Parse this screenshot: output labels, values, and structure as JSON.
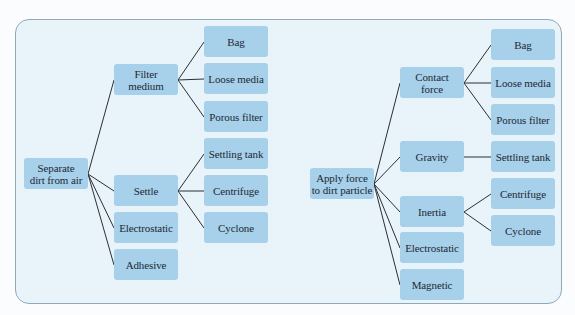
{
  "colors": {
    "panel_background": "#e8f3fa",
    "panel_border": "#8fa9bb",
    "node_fill": "#a7d0ea",
    "node_text": "#1d2933",
    "connector": "#2c2f33"
  },
  "left_tree": {
    "root": "Separate\ndirt from air",
    "branches": [
      {
        "label": "Filter\nmedium",
        "children": [
          "Bag",
          "Loose media",
          "Porous filter"
        ]
      },
      {
        "label": "Settle",
        "children": [
          "Settling tank",
          "Centrifuge",
          "Cyclone"
        ]
      },
      {
        "label": "Electrostatic",
        "children": []
      },
      {
        "label": "Adhesive",
        "children": []
      }
    ]
  },
  "right_tree": {
    "root": "Apply force\nto dirt particle",
    "branches": [
      {
        "label": "Contact\nforce",
        "children": [
          "Bag",
          "Loose media",
          "Porous filter"
        ]
      },
      {
        "label": "Gravity",
        "children": [
          "Settling tank"
        ]
      },
      {
        "label": "Inertia",
        "children": [
          "Centrifuge",
          "Cyclone"
        ]
      },
      {
        "label": "Electrostatic",
        "children": []
      },
      {
        "label": "Magnetic",
        "children": []
      }
    ]
  }
}
